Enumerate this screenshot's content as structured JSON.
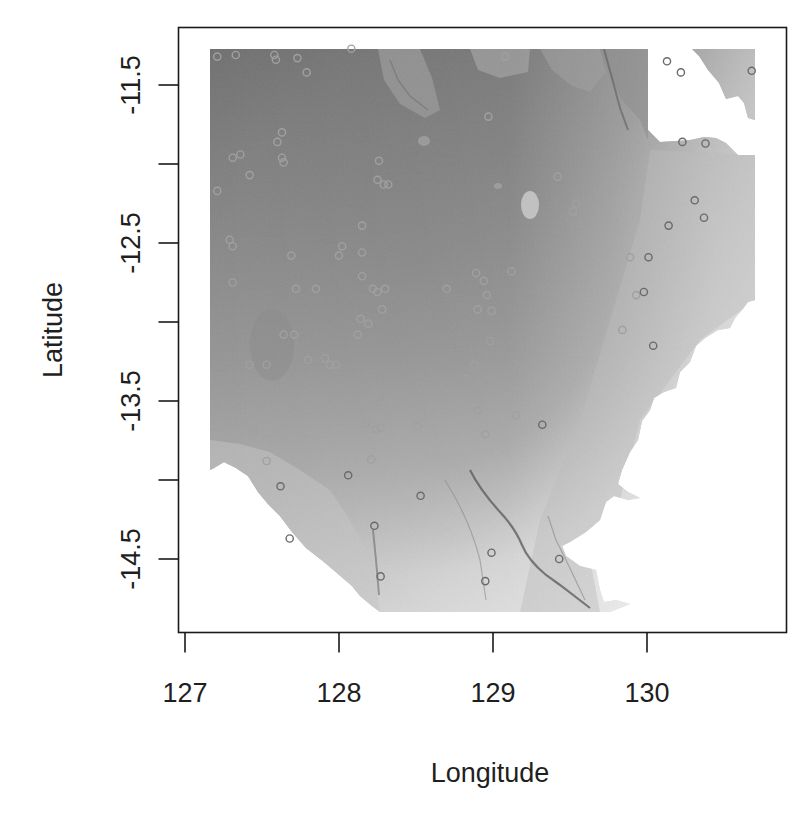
{
  "chart_data": {
    "type": "scatter",
    "subtype": "raster-map-with-point-overlay",
    "title": "",
    "xlabel": "Longitude",
    "ylabel": "Latitude",
    "xlim": [
      126.9,
      130.9
    ],
    "ylim": [
      -15.0,
      -11.1
    ],
    "x_ticks": [
      127,
      128,
      129,
      130
    ],
    "x_tick_labels": [
      "127",
      "128",
      "129",
      "130"
    ],
    "y_ticks": [
      -11.5,
      -12.0,
      -12.5,
      -13.0,
      -13.5,
      -14.0,
      -14.5
    ],
    "y_tick_labels": [
      "-11.5",
      "",
      "-12.5",
      "",
      "-13.5",
      "",
      "-14.5"
    ],
    "grid": false,
    "legend": null,
    "raster": {
      "description": "Grayscale bathymetry/elevation raster; darker = deeper water, lighter = shallower, white = land / no data",
      "extent": {
        "lon_min": 127.16,
        "lon_max": 130.7,
        "lat_min": -14.84,
        "lat_max": -11.27
      },
      "colors": {
        "deep": "#6e6e6e",
        "mid": "#8f8f8f",
        "shallow": "#c4c4c4",
        "very_shallow": "#dcdcdc",
        "land": "#ffffff",
        "channel": "#555555"
      }
    },
    "points": {
      "marker": "open-circle",
      "marker_color_on_dark": "#a0a0a0",
      "marker_color_on_light": "#6a6a6a",
      "lon": [
        127.21,
        127.33,
        127.58,
        127.59,
        127.73,
        127.79,
        128.08,
        129.08,
        130.13,
        130.22,
        130.68,
        128.97,
        127.6,
        127.63,
        127.31,
        127.36,
        127.63,
        127.64,
        127.42,
        127.21,
        128.26,
        128.25,
        128.29,
        128.32,
        129.42,
        129.54,
        129.52,
        130.31,
        130.14,
        130.37,
        130.38,
        130.23,
        128.15,
        127.29,
        127.69,
        127.31,
        128.02,
        128.0,
        128.15,
        128.15,
        127.31,
        127.72,
        127.85,
        128.22,
        128.25,
        128.3,
        128.28,
        128.7,
        128.89,
        129.12,
        128.94,
        128.96,
        128.9,
        128.99,
        128.14,
        128.19,
        128.12,
        129.36,
        129.33,
        130.04,
        129.84,
        129.93,
        129.98,
        129.89,
        130.01,
        128.98,
        127.64,
        127.71,
        127.42,
        127.53,
        127.8,
        127.91,
        127.94,
        127.98,
        128.88,
        129.13,
        128.83,
        128.22,
        127.83,
        128.02,
        127.23,
        127.45,
        128.18,
        128.24,
        128.27,
        128.51,
        128.9,
        129.15,
        129.32,
        128.95,
        127.53,
        128.21,
        128.06,
        127.62,
        128.53,
        128.23,
        127.68,
        128.99,
        129.43,
        128.95,
        128.27
      ],
      "lat": [
        -11.32,
        -11.31,
        -11.31,
        -11.34,
        -11.33,
        -11.42,
        -11.27,
        -11.32,
        -11.35,
        -11.42,
        -11.41,
        -11.7,
        -11.86,
        -11.8,
        -11.96,
        -11.94,
        -11.96,
        -11.99,
        -12.07,
        -12.17,
        -11.98,
        -12.1,
        -12.13,
        -12.13,
        -12.08,
        -12.25,
        -12.3,
        -12.23,
        -12.39,
        -12.34,
        -11.87,
        -11.86,
        -12.39,
        -12.48,
        -12.58,
        -12.52,
        -12.52,
        -12.58,
        -12.56,
        -12.71,
        -12.75,
        -12.79,
        -12.79,
        -12.79,
        -12.81,
        -12.79,
        -12.92,
        -12.79,
        -12.69,
        -12.68,
        -12.74,
        -12.83,
        -12.92,
        -12.93,
        -12.98,
        -13.01,
        -13.08,
        -13.05,
        -13.03,
        -13.15,
        -13.05,
        -12.83,
        -12.81,
        -12.59,
        -12.59,
        -13.12,
        -13.08,
        -13.08,
        -13.27,
        -13.27,
        -13.24,
        -13.23,
        -13.27,
        -13.27,
        -13.27,
        -13.27,
        -13.36,
        -13.46,
        -13.53,
        -13.57,
        -13.6,
        -13.69,
        -13.64,
        -13.68,
        -13.67,
        -13.66,
        -13.56,
        -13.59,
        -13.65,
        -13.71,
        -13.88,
        -13.87,
        -13.97,
        -14.04,
        -14.1,
        -14.29,
        -14.37,
        -14.46,
        -14.5,
        -14.64,
        -14.61
      ]
    }
  }
}
